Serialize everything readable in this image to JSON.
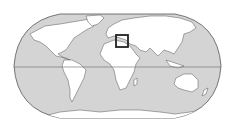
{
  "map": {
    "projection": "robinson",
    "ocean_color": "#d4d4d4",
    "land_color": "#ffffff",
    "coast_color": "#555555",
    "equator_color": "#666666",
    "highlight": {
      "region": "Eastern Mediterranean",
      "x": 116,
      "y": 35,
      "width": 12,
      "height": 12,
      "stroke_color": "#222222"
    }
  }
}
